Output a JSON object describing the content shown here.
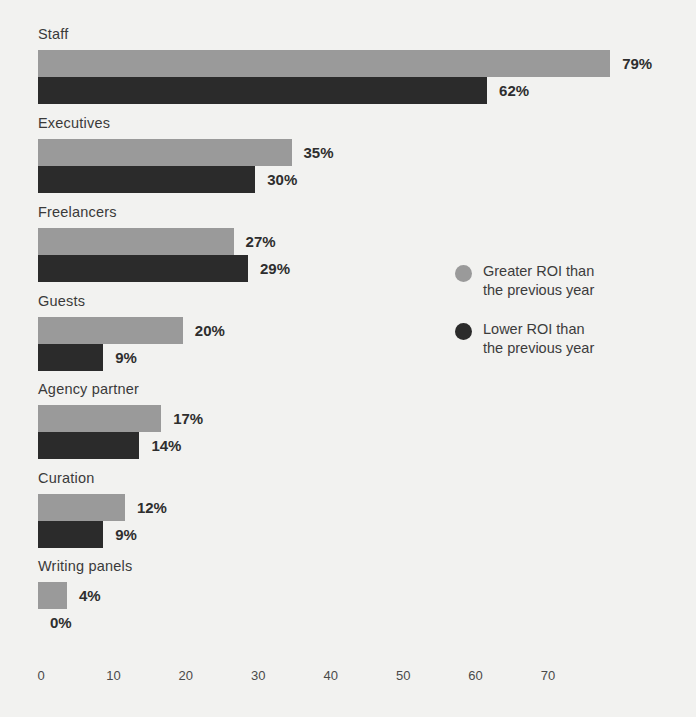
{
  "chart_data": {
    "type": "bar",
    "orientation": "horizontal",
    "title": "",
    "subtitle": "",
    "xlabel": "",
    "ylabel": "",
    "xlim": [
      0,
      79
    ],
    "xticks": [
      0,
      10,
      20,
      30,
      40,
      50,
      60,
      70
    ],
    "xtick_labels": [
      "0",
      "10",
      "20",
      "30",
      "40",
      "50",
      "60",
      "70"
    ],
    "grid": false,
    "legend_position": "right-middle",
    "categories": [
      "Staff",
      "Executives",
      "Freelancers",
      "Guests",
      "Agency partner",
      "Curation",
      "Writing panels"
    ],
    "series": [
      {
        "name": "Greater ROI than the previous year",
        "color": "#9a9a9a",
        "values": [
          79,
          35,
          27,
          20,
          17,
          12,
          4
        ],
        "value_labels": [
          "79%",
          "35%",
          "27%",
          "20%",
          "17%",
          "12%",
          "4%"
        ]
      },
      {
        "name": "Lower ROI than the previous year",
        "color": "#2b2b2b",
        "values": [
          62,
          30,
          29,
          9,
          14,
          9,
          0
        ],
        "value_labels": [
          "62%",
          "30%",
          "29%",
          "9%",
          "14%",
          "9%",
          "0%"
        ]
      }
    ]
  },
  "legend": {
    "items": [
      {
        "label_line1": "Greater ROI than",
        "label_line2": "the previous year",
        "color": "#9a9a9a"
      },
      {
        "label_line1": "Lower ROI than",
        "label_line2": "the previous year",
        "color": "#2b2b2b"
      }
    ]
  },
  "colors": {
    "background": "#f2f2f0",
    "greater": "#9a9a9a",
    "lower": "#2b2b2b",
    "text": "#3a3a3a",
    "value_text": "#2e2e2e"
  }
}
